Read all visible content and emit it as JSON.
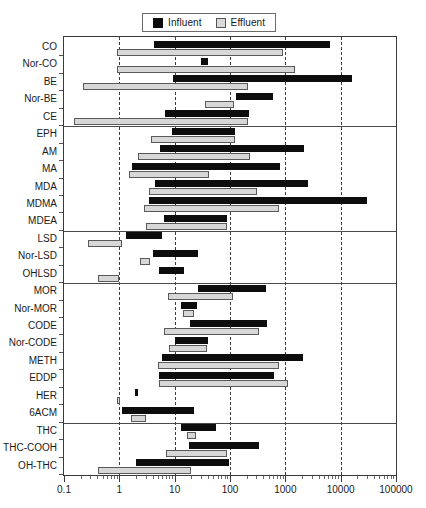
{
  "legend": {
    "entries": [
      {
        "label": "Influent",
        "color": "#0d0d0d",
        "key": "influent"
      },
      {
        "label": "Effluent",
        "color": "#d7d7d7",
        "key": "effluent"
      }
    ]
  },
  "axis": {
    "tick_labels": [
      "0.1",
      "1",
      "10",
      "100",
      "1000",
      "10000",
      "100000"
    ]
  },
  "chart_data": {
    "type": "bar",
    "orientation": "horizontal",
    "subtype": "range-bar (floating bar showing min-max concentration range)",
    "title": "",
    "xlabel": "",
    "ylabel": "",
    "xscale": "log",
    "xlim": [
      0.1,
      100000
    ],
    "xticks": [
      0.1,
      1,
      10,
      100,
      1000,
      10000,
      100000
    ],
    "xtick_labels": [
      "0.1",
      "1",
      "10",
      "100",
      "1000",
      "10000",
      "100000"
    ],
    "grid": "vertical dashed gridlines at each decade",
    "legend_position": "top-center, outside plot",
    "series_names": [
      "Influent",
      "Effluent"
    ],
    "series_colors": [
      "#0d0d0d",
      "#d7d7d7"
    ],
    "group_separators_after": [
      "CE",
      "MDEA",
      "OHLSD",
      "6ACM"
    ],
    "categories": [
      "CO",
      "Nor-CO",
      "BE",
      "Nor-BE",
      "CE",
      "EPH",
      "AM",
      "MA",
      "MDA",
      "MDMA",
      "MDEA",
      "LSD",
      "Nor-LSD",
      "OHLSD",
      "MOR",
      "Nor-MOR",
      "CODE",
      "Nor-CODE",
      "METH",
      "EDDP",
      "HER",
      "6ACM",
      "THC",
      "THC-COOH",
      "OH-THC"
    ],
    "series": [
      {
        "name": "Influent",
        "ranges": [
          {
            "category": "CO",
            "min": 4.3,
            "max": 6300
          },
          {
            "category": "Nor-CO",
            "min": 30,
            "max": 40
          },
          {
            "category": "BE",
            "min": 9.5,
            "max": 16000
          },
          {
            "category": "Nor-BE",
            "min": 130,
            "max": 600
          },
          {
            "category": "CE",
            "min": 6.8,
            "max": 220
          },
          {
            "category": "EPH",
            "min": 9.0,
            "max": 125
          },
          {
            "category": "AM",
            "min": 5.5,
            "max": 2200
          },
          {
            "category": "MA",
            "min": 1.7,
            "max": 800
          },
          {
            "category": "MDA",
            "min": 4.5,
            "max": 2600
          },
          {
            "category": "MDMA",
            "min": 3.5,
            "max": 30000
          },
          {
            "category": "MDEA",
            "min": 6.5,
            "max": 90
          },
          {
            "category": "LSD",
            "min": 1.3,
            "max": 6.0
          },
          {
            "category": "Nor-LSD",
            "min": 4.0,
            "max": 26
          },
          {
            "category": "OHLSD",
            "min": 5.2,
            "max": 15
          },
          {
            "category": "MOR",
            "min": 26,
            "max": 450
          },
          {
            "category": "Nor-MOR",
            "min": 13,
            "max": 25
          },
          {
            "category": "CODE",
            "min": 19,
            "max": 460
          },
          {
            "category": "Nor-CODE",
            "min": 10,
            "max": 40
          },
          {
            "category": "METH",
            "min": 5.8,
            "max": 2100
          },
          {
            "category": "EDDP",
            "min": 5.2,
            "max": 620
          },
          {
            "category": "HER",
            "min": 1.9,
            "max": 2.1
          },
          {
            "category": "6ACM",
            "min": 1.1,
            "max": 22
          },
          {
            "category": "THC",
            "min": 13,
            "max": 55
          },
          {
            "category": "THC-COOH",
            "min": 18,
            "max": 330
          },
          {
            "category": "OH-THC",
            "min": 2.0,
            "max": 95
          }
        ]
      },
      {
        "name": "Effluent",
        "ranges": [
          {
            "category": "CO",
            "min": 0.9,
            "max": 900
          },
          {
            "category": "Nor-CO",
            "min": 0.9,
            "max": 1500
          },
          {
            "category": "BE",
            "min": 0.22,
            "max": 210
          },
          {
            "category": "Nor-BE",
            "min": 35,
            "max": 120
          },
          {
            "category": "CE",
            "min": 0.15,
            "max": 210
          },
          {
            "category": "EPH",
            "min": 3.8,
            "max": 125
          },
          {
            "category": "AM",
            "min": 2.2,
            "max": 230
          },
          {
            "category": "MA",
            "min": 1.5,
            "max": 42
          },
          {
            "category": "MDA",
            "min": 3.5,
            "max": 310
          },
          {
            "category": "MDMA",
            "min": 2.8,
            "max": 780
          },
          {
            "category": "MDEA",
            "min": 3.0,
            "max": 90
          },
          {
            "category": "LSD",
            "min": 0.27,
            "max": 1.1
          },
          {
            "category": "Nor-LSD",
            "min": 2.4,
            "max": 3.6
          },
          {
            "category": "OHLSD",
            "min": 0.42,
            "max": 1.0
          },
          {
            "category": "MOR",
            "min": 7.5,
            "max": 115
          },
          {
            "category": "Nor-MOR",
            "min": 14,
            "max": 22
          },
          {
            "category": "CODE",
            "min": 6.5,
            "max": 330
          },
          {
            "category": "Nor-CODE",
            "min": 8.0,
            "max": 38
          },
          {
            "category": "METH",
            "min": 5.0,
            "max": 760
          },
          {
            "category": "EDDP",
            "min": 5.2,
            "max": 1100
          },
          {
            "category": "HER",
            "min": 0.9,
            "max": 1.0
          },
          {
            "category": "6ACM",
            "min": 1.6,
            "max": 3.0
          },
          {
            "category": "THC",
            "min": 17,
            "max": 24
          },
          {
            "category": "THC-COOH",
            "min": 7.0,
            "max": 90
          },
          {
            "category": "OH-THC",
            "min": 0.42,
            "max": 20
          }
        ]
      }
    ]
  }
}
